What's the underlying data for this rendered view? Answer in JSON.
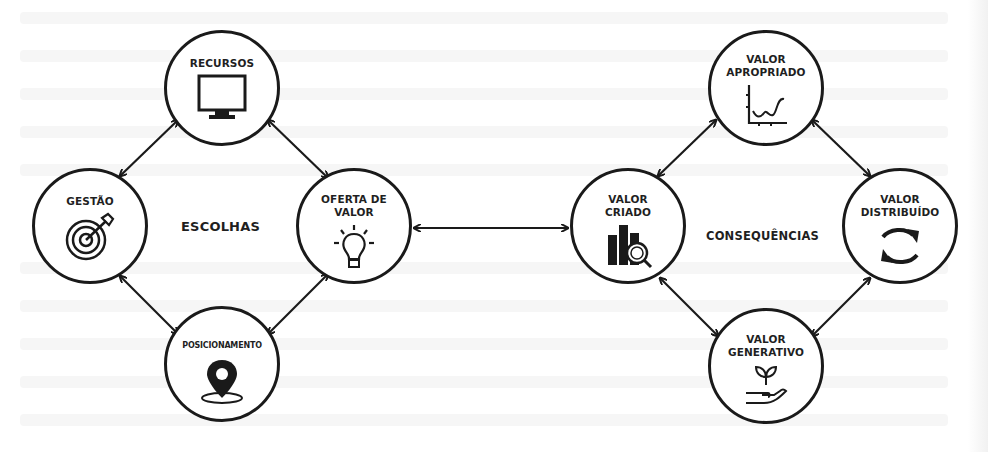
{
  "diagram": {
    "groups": {
      "left": {
        "label": "ESCOLHAS"
      },
      "right": {
        "label": "CONSEQUÊNCIAS"
      }
    },
    "nodes": {
      "recursos": {
        "label": "RECURSOS",
        "icon": "monitor-icon"
      },
      "gestao": {
        "label": "GESTÃO",
        "icon": "target-icon"
      },
      "oferta": {
        "label": "OFERTA DE\nVALOR",
        "icon": "lightbulb-icon"
      },
      "posicionamento": {
        "label": "POSICIONAMENTO",
        "icon": "location-pin-icon"
      },
      "criado": {
        "label": "VALOR\nCRIADO",
        "icon": "bar-chart-magnifier-icon"
      },
      "apropriado": {
        "label": "VALOR\nAPROPRIADO",
        "icon": "line-chart-icon"
      },
      "distribuido": {
        "label": "VALOR\nDISTRIBUÍDO",
        "icon": "refresh-arrows-icon"
      },
      "generativo": {
        "label": "VALOR\nGENERATIVO",
        "icon": "plant-in-hand-icon"
      }
    },
    "edges": [
      {
        "from": "GESTÃO",
        "to": "RECURSOS",
        "type": "bidirectional"
      },
      {
        "from": "RECURSOS",
        "to": "OFERTA DE VALOR",
        "type": "bidirectional"
      },
      {
        "from": "OFERTA DE VALOR",
        "to": "POSICIONAMENTO",
        "type": "bidirectional"
      },
      {
        "from": "POSICIONAMENTO",
        "to": "GESTÃO",
        "type": "bidirectional"
      },
      {
        "from": "OFERTA DE VALOR",
        "to": "VALOR CRIADO",
        "type": "bidirectional"
      },
      {
        "from": "VALOR CRIADO",
        "to": "VALOR APROPRIADO",
        "type": "bidirectional"
      },
      {
        "from": "VALOR APROPRIADO",
        "to": "VALOR DISTRIBUÍDO",
        "type": "bidirectional"
      },
      {
        "from": "VALOR DISTRIBUÍDO",
        "to": "VALOR GENERATIVO",
        "type": "bidirectional"
      },
      {
        "from": "VALOR GENERATIVO",
        "to": "VALOR CRIADO",
        "type": "bidirectional"
      }
    ],
    "colors": {
      "stroke": "#1a1a1a",
      "background": "#ffffff"
    }
  }
}
